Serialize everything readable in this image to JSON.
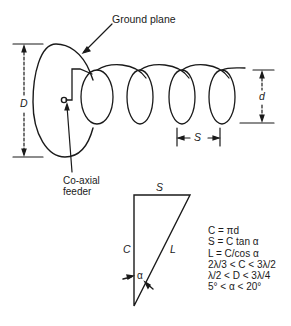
{
  "diagram": {
    "labels": {
      "ground_plane": "Ground plane",
      "coaxial_feeder_line1": "Co-axial",
      "coaxial_feeder_line2": "feeder",
      "D": "D",
      "d": "d",
      "S_helix": "S",
      "S_triangle": "S",
      "C": "C",
      "L": "L",
      "alpha": "α"
    },
    "formulas": [
      "C = πd",
      "S = C tan α",
      "L = C/cos α",
      "2λ/3 < C < 3λ/2",
      "λ/2 < D < 3λ/4",
      "5° < α < 20°"
    ],
    "colors": {
      "line": "#1a1a1a",
      "background": "#ffffff"
    }
  }
}
